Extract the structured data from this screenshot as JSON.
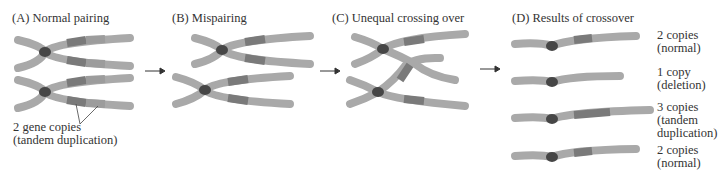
{
  "panels": [
    {
      "id": "A",
      "title": "(A)  Normal pairing"
    },
    {
      "id": "B",
      "title": "(B)  Mispairing"
    },
    {
      "id": "C",
      "title": "(C)  Unequal crossing over"
    },
    {
      "id": "D",
      "title": "(D)  Results of crossover"
    }
  ],
  "annotation": {
    "line1": "2 gene copies",
    "line2": "(tandem duplication)"
  },
  "results": [
    {
      "line1": "2 copies",
      "line2": "(normal)"
    },
    {
      "line1": "1 copy",
      "line2": "(deletion)"
    },
    {
      "line1": "3 copies",
      "line2": "(tandem",
      "line3": "duplication)"
    },
    {
      "line1": "2 copies",
      "line2": "(normal)"
    }
  ],
  "colors": {
    "chromosome": "#a9a9a9",
    "gene": "#7a7a7a",
    "centromere": "#464646",
    "divider": "#959595"
  }
}
